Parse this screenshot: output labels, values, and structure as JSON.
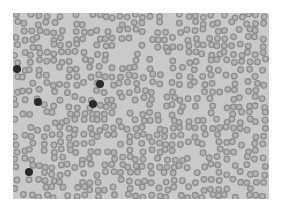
{
  "image": {
    "description": "Grayscale light-microscopy blood smear showing numerous red blood cells and a few dark-stained white blood cells",
    "background_color": "#c9c9c9",
    "cell_color": "#8c8c8c",
    "cell_center_color": "#b4b4b4",
    "dark_cell_color": "#2a2a2a",
    "dark_cells": [
      {
        "x": 4,
        "y": 56,
        "r": 4
      },
      {
        "x": 25,
        "y": 89,
        "r": 4
      },
      {
        "x": 87,
        "y": 71,
        "r": 4
      },
      {
        "x": 80,
        "y": 91,
        "r": 4
      },
      {
        "x": 16,
        "y": 159,
        "r": 4
      }
    ]
  }
}
